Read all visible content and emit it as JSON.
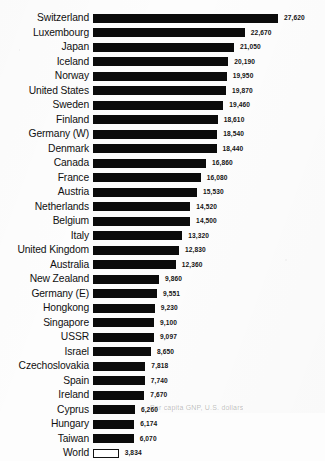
{
  "chart_data": {
    "type": "bar",
    "orientation": "horizontal",
    "title": "",
    "subtitle": "",
    "xlabel": "",
    "ylabel": "",
    "xlim": [
      0,
      27620
    ],
    "grid": false,
    "legend": null,
    "value_format": "comma-separated integers",
    "note": "Bars are solid black except the final 'World' row which is drawn as a hollow/outlined bar.",
    "categories": [
      "Switzerland",
      "Luxembourg",
      "Japan",
      "Iceland",
      "Norway",
      "United States",
      "Sweden",
      "Finland",
      "Germany (W)",
      "Denmark",
      "Canada",
      "France",
      "Austria",
      "Netherlands",
      "Belgium",
      "Italy",
      "United Kingdom",
      "Australia",
      "New Zealand",
      "Germany (E)",
      "Hongkong",
      "Singapore",
      "USSR",
      "Israel",
      "Czechoslovakia",
      "Spain",
      "Ireland",
      "Cyprus",
      "Hungary",
      "Taiwan",
      "World"
    ],
    "values": [
      27620,
      22670,
      21050,
      20190,
      19950,
      19870,
      19460,
      18610,
      18540,
      18440,
      16860,
      16080,
      15530,
      14520,
      14500,
      13320,
      12830,
      12360,
      9860,
      9551,
      9230,
      9100,
      9097,
      8650,
      7818,
      7740,
      7670,
      6260,
      6174,
      6070,
      3834
    ],
    "value_labels": [
      "27,620",
      "22,670",
      "21,050",
      "20,190",
      "19,950",
      "19,870",
      "19,460",
      "18,610",
      "18,540",
      "18,440",
      "16,860",
      "16,080",
      "15,530",
      "14,520",
      "14,500",
      "13,320",
      "12,830",
      "12,360",
      "9,860",
      "9,551",
      "9,230",
      "9,100",
      "9,097",
      "8,650",
      "7,818",
      "7,740",
      "7,670",
      "6,260",
      "6,174",
      "6,070",
      "3,834"
    ],
    "hollow_bars": [
      "World"
    ]
  },
  "footnote": {
    "text": "Per capita GNP, U.S. dollars"
  },
  "colors": {
    "bar_fill": "#0b0b0b",
    "bar_outline": "#121212",
    "background": "#fdfdfd",
    "label_text": "#101010",
    "value_text": "#141414"
  }
}
